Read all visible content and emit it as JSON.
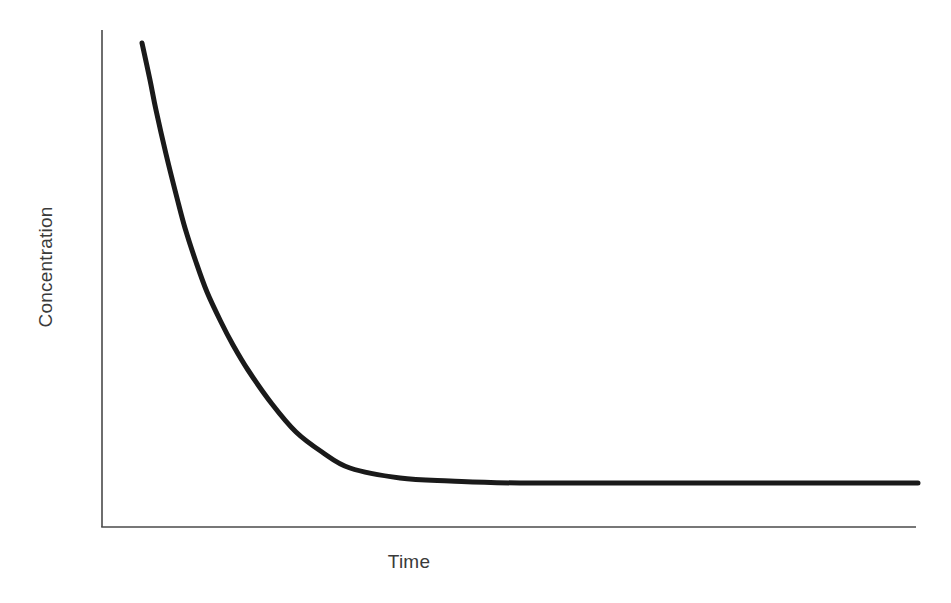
{
  "chart_data": {
    "type": "line",
    "title": "",
    "subtitle": "",
    "xlabel": "Time",
    "ylabel": "Concentration",
    "legend": [],
    "legend_position": "none",
    "grid": false,
    "xticks": [],
    "yticks": [],
    "xtick_labels": [],
    "ytick_labels": [],
    "xlim": [
      0,
      1
    ],
    "ylim": [
      0,
      1
    ],
    "annotations": [],
    "series": [
      {
        "name": "Concentration decay",
        "color": "#1a1a1a",
        "line_width": 5,
        "x": [
          0.0,
          0.01,
          0.02,
          0.04,
          0.07,
          0.09,
          0.12,
          0.15,
          0.19,
          0.22,
          0.26,
          0.32,
          0.38,
          0.44,
          0.5,
          0.6,
          0.7,
          0.8,
          0.9,
          1.0
        ],
        "y": [
          1.0,
          0.92,
          0.855,
          0.76,
          0.665,
          0.6,
          0.525,
          0.46,
          0.395,
          0.345,
          0.29,
          0.215,
          0.155,
          0.11,
          0.075,
          0.035,
          0.015,
          0.008,
          0.004,
          0.002
        ],
        "pixel_points": [
          [
            142,
            43
          ],
          [
            150,
            80
          ],
          [
            156,
            110
          ],
          [
            166,
            154
          ],
          [
            177,
            198
          ],
          [
            185,
            228
          ],
          [
            196,
            262
          ],
          [
            207,
            292
          ],
          [
            221,
            322
          ],
          [
            233,
            345
          ],
          [
            248,
            370
          ],
          [
            272,
            404
          ],
          [
            296,
            432
          ],
          [
            322,
            452
          ],
          [
            350,
            468
          ],
          [
            400,
            478
          ],
          [
            450,
            481
          ],
          [
            520,
            483
          ],
          [
            700,
            483
          ],
          [
            918,
            483
          ]
        ]
      }
    ],
    "axes": {
      "color": "#4a4a4a",
      "line_width": 1.6,
      "origin_px": [
        102,
        527
      ],
      "y_axis_top_px": [
        102,
        30
      ],
      "x_axis_right_px": [
        916,
        527
      ],
      "spines": [
        "left",
        "bottom"
      ],
      "ticks_visible": false
    },
    "background_color": "#ffffff",
    "text_color": "#3a3a3a"
  }
}
